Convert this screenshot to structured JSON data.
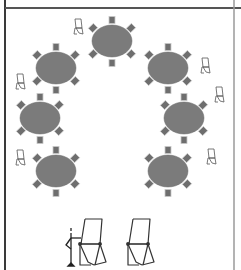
{
  "diagram": {
    "type": "room-layout",
    "style": "semicircle cabaret seating",
    "colors": {
      "background": "#ffffff",
      "wall_left": "#3a3a3a",
      "wall_top": "#555555",
      "wall_right": "#9a9a9a",
      "table_fill": "#7b7b7b",
      "chair_fill": "#6e6e6e",
      "chair_stroke": "#c8c8c8",
      "flipchart_stroke": "#333333",
      "small_flipchart_stroke": "#555555"
    },
    "walls": {
      "left_x": 5,
      "top_y": 8,
      "right_x": 234
    },
    "tables": [
      {
        "id": "table-top",
        "cx": 112,
        "cy": 41,
        "rx": 20,
        "ry": 16,
        "chairs": 6
      },
      {
        "id": "table-upper-left",
        "cx": 56,
        "cy": 68,
        "rx": 20,
        "ry": 16,
        "chairs": 6
      },
      {
        "id": "table-upper-right",
        "cx": 168,
        "cy": 68,
        "rx": 20,
        "ry": 16,
        "chairs": 6
      },
      {
        "id": "table-middle-left",
        "cx": 40,
        "cy": 118,
        "rx": 20,
        "ry": 16,
        "chairs": 6
      },
      {
        "id": "table-middle-right",
        "cx": 184,
        "cy": 118,
        "rx": 20,
        "ry": 16,
        "chairs": 6
      },
      {
        "id": "table-lower-left",
        "cx": 56,
        "cy": 171,
        "rx": 20,
        "ry": 16,
        "chairs": 6
      },
      {
        "id": "table-lower-right",
        "cx": 168,
        "cy": 171,
        "rx": 20,
        "ry": 16,
        "chairs": 6
      }
    ],
    "small_flipcharts": [
      {
        "id": "small-flipchart-1",
        "x": 78,
        "y": 27
      },
      {
        "id": "small-flipchart-2",
        "x": 20,
        "y": 82
      },
      {
        "id": "small-flipchart-3",
        "x": 20,
        "y": 158
      },
      {
        "id": "small-flipchart-4",
        "x": 205,
        "y": 66
      },
      {
        "id": "small-flipchart-5",
        "x": 219,
        "y": 95
      },
      {
        "id": "small-flipchart-6",
        "x": 211,
        "y": 157
      }
    ],
    "large_flipcharts": [
      {
        "id": "large-flipchart-left",
        "x": 92,
        "y": 248
      },
      {
        "id": "large-flipchart-right",
        "x": 140,
        "y": 248
      }
    ],
    "presenter": {
      "x": 71,
      "y": 236
    }
  }
}
